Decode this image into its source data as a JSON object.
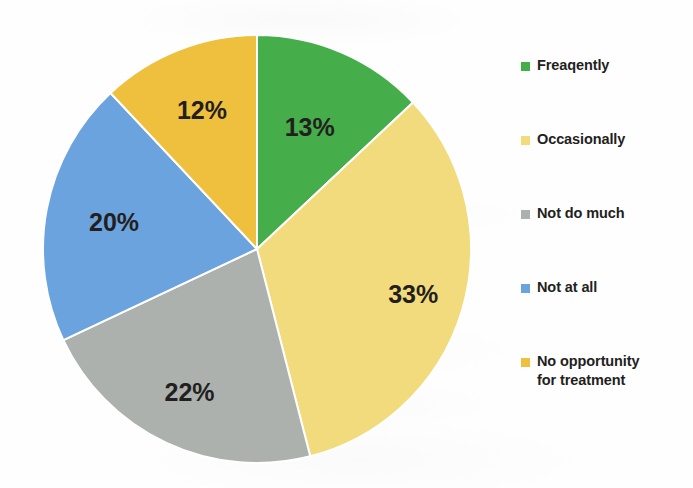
{
  "chart_data": {
    "type": "pie",
    "title": "",
    "subtitle": "",
    "xlabel": "",
    "ylabel": "",
    "legend_position": "right",
    "grid": false,
    "units": "percent",
    "start_angle_deg": 0,
    "direction": "clockwise",
    "categories": [
      "Freaqently",
      "Occasionally",
      "Not do much",
      "Not at all",
      "No opportunity for treatment"
    ],
    "values": [
      13,
      33,
      22,
      20,
      12
    ],
    "value_labels": [
      "13%",
      "33%",
      "22%",
      "20%",
      "12%"
    ],
    "colors": [
      "#45ad4a",
      "#f2db7c",
      "#acb1ad",
      "#6ba3de",
      "#efc03e"
    ],
    "slices": [
      {
        "label": "Freaqently",
        "value": 13,
        "value_label": "13%",
        "color": "#45ad4a",
        "start_deg": 0,
        "end_deg": 46.8,
        "label_radius_frac": 0.62
      },
      {
        "label": "Occasionally",
        "value": 33,
        "value_label": "33%",
        "color": "#f2db7c",
        "start_deg": 46.8,
        "end_deg": 165.6,
        "label_radius_frac": 0.76
      },
      {
        "label": "Not do much",
        "value": 22,
        "value_label": "22%",
        "color": "#acb1ad",
        "start_deg": 165.6,
        "end_deg": 244.8,
        "label_radius_frac": 0.74
      },
      {
        "label": "Not at all",
        "value": 20,
        "value_label": "20%",
        "color": "#6ba3de",
        "start_deg": 244.8,
        "end_deg": 316.8,
        "label_radius_frac": 0.68
      },
      {
        "label": "No opportunity for treatment",
        "value": 12,
        "value_label": "12%",
        "color": "#efc03e",
        "start_deg": 316.8,
        "end_deg": 360,
        "label_radius_frac": 0.7
      }
    ]
  },
  "pie": {
    "labels": {
      "frequently": "13%",
      "occasionally": "33%",
      "not_do_much": "22%",
      "not_at_all": "20%",
      "no_opportunity": "12%"
    }
  },
  "legend": {
    "items": [
      {
        "label": "Freaqently",
        "color": "#45ad4a"
      },
      {
        "label": "Occasionally",
        "color": "#f2db7c"
      },
      {
        "label": "Not do much",
        "color": "#acb1ad"
      },
      {
        "label": "Not at all",
        "color": "#6ba3de"
      },
      {
        "label": "No opportunity\nfor treatment",
        "color": "#efc03e"
      }
    ]
  }
}
